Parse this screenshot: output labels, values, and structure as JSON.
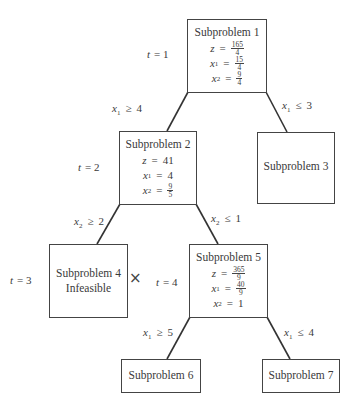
{
  "diagram": {
    "type": "branch-and-bound tree",
    "nodes": [
      {
        "id": 1,
        "title": "Subproblem 1",
        "t_label": {
          "var": "t",
          "eq": "=",
          "value": "1"
        },
        "z": {
          "num": "165",
          "den": "4"
        },
        "x1": {
          "num": "15",
          "den": "4"
        },
        "x2": {
          "num": "9",
          "den": "4"
        }
      },
      {
        "id": 2,
        "title": "Subproblem 2",
        "t_label": {
          "var": "t",
          "eq": "=",
          "value": "2"
        },
        "z": "41",
        "x1": "4",
        "x2": {
          "num": "9",
          "den": "5"
        }
      },
      {
        "id": 3,
        "title": "Subproblem 3"
      },
      {
        "id": 4,
        "title": "Subproblem 4",
        "status": "Infeasible",
        "t_label": {
          "var": "t",
          "eq": "=",
          "value": "3"
        },
        "mark": "×"
      },
      {
        "id": 5,
        "title": "Subproblem 5",
        "t_label": {
          "var": "t",
          "eq": "=",
          "value": "4"
        },
        "z": {
          "num": "365",
          "den": "9"
        },
        "x1": {
          "num": "40",
          "den": "9"
        },
        "x2": "1"
      },
      {
        "id": 6,
        "title": "Subproblem 6"
      },
      {
        "id": 7,
        "title": "Subproblem 7"
      }
    ],
    "edges": [
      {
        "from": 1,
        "to": 2,
        "var": "x",
        "sub": "1",
        "op": "≥",
        "value": "4"
      },
      {
        "from": 1,
        "to": 3,
        "var": "x",
        "sub": "1",
        "op": "≤",
        "value": "3"
      },
      {
        "from": 2,
        "to": 4,
        "var": "x",
        "sub": "2",
        "op": "≥",
        "value": "2"
      },
      {
        "from": 2,
        "to": 5,
        "var": "x",
        "sub": "2",
        "op": "≤",
        "value": "1"
      },
      {
        "from": 5,
        "to": 6,
        "var": "x",
        "sub": "1",
        "op": "≥",
        "value": "5"
      },
      {
        "from": 5,
        "to": 7,
        "var": "x",
        "sub": "1",
        "op": "≤",
        "value": "4"
      }
    ],
    "symbols": {
      "z": "z",
      "x": "x",
      "t": "t",
      "eq": "=",
      "sub1": "1",
      "sub2": "2"
    }
  }
}
